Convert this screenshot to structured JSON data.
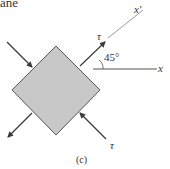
{
  "header_fragment": "ane",
  "labels": {
    "tau_top": "τ",
    "tau_bottom": "τ",
    "angle": "45°",
    "x_prime": "x′",
    "x": "x",
    "caption": "(c)"
  },
  "colors": {
    "element_fill": "#c8c8c8",
    "stroke": "#3a3a3a",
    "axis": "#555555"
  }
}
